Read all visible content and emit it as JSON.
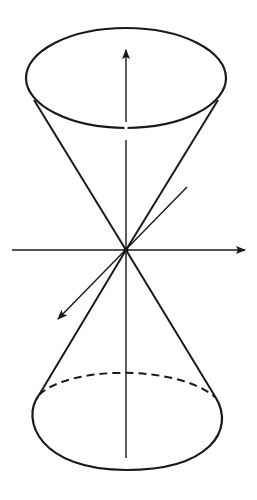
{
  "diagram": {
    "stroke_color": "#1a1a1a",
    "background": "#ffffff",
    "elements": [
      {
        "name": "top-ellipse",
        "type": "ellipse",
        "cx": 126,
        "cy": 78,
        "rx": 100,
        "ry": 50
      },
      {
        "name": "bottom-ellipse-front",
        "type": "arc",
        "style": "solid"
      },
      {
        "name": "bottom-ellipse-back",
        "type": "arc",
        "style": "dashed"
      },
      {
        "name": "apex",
        "x": 126,
        "y": 250
      },
      {
        "name": "vertical-axis",
        "arrow": "up"
      },
      {
        "name": "horizontal-axis",
        "arrow": "right"
      },
      {
        "name": "depth-axis",
        "arrow": "down-left"
      }
    ]
  }
}
